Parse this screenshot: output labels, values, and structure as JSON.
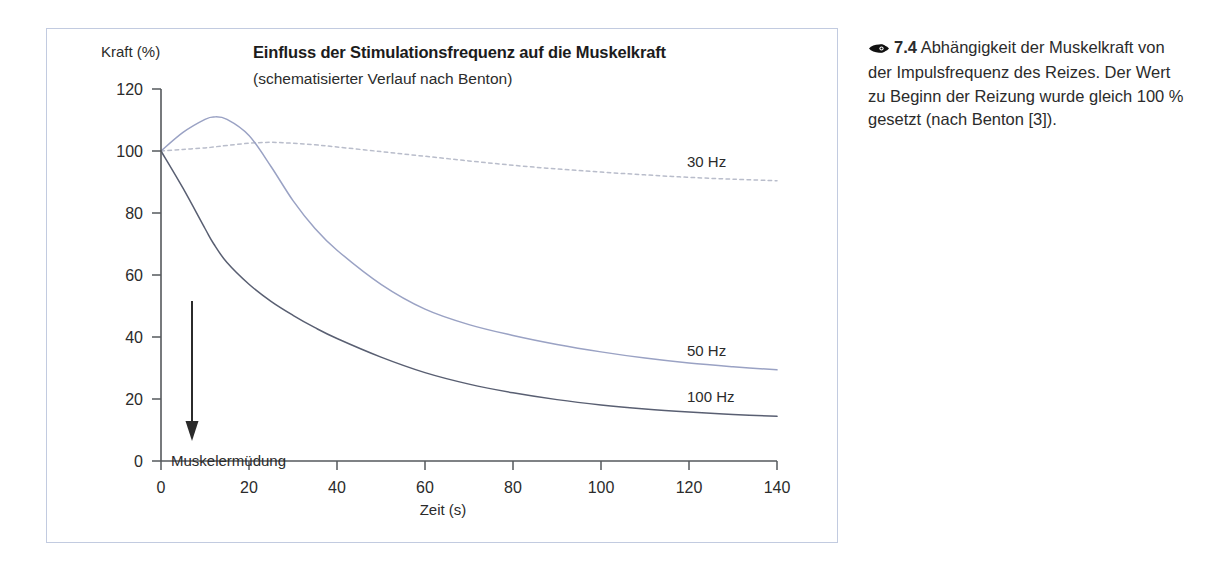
{
  "figure": {
    "caption_icon": "eye-icon",
    "caption_number": "7.4",
    "caption_text": "Abhängigkeit der Muskelkraft von der Impulsfrequenz des Reizes. Der Wert zu Beginn der Reizung wurde gleich 100 % gesetzt (nach Benton [3])."
  },
  "chart_data": {
    "type": "line",
    "title": "Einfluss der Stimulationsfrequenz auf die Muskelkraft",
    "subtitle": "(schematisierter Verlauf nach Benton)",
    "xlabel": "Zeit (s)",
    "ylabel": "Kraft (%)",
    "xlim": [
      0,
      140
    ],
    "ylim": [
      0,
      120
    ],
    "xticks": [
      0,
      20,
      40,
      60,
      80,
      100,
      120,
      140
    ],
    "yticks": [
      0,
      20,
      40,
      60,
      80,
      100,
      120
    ],
    "grid": false,
    "legend_position": "inline-right",
    "annotations": [
      {
        "text": "Muskelermüdung",
        "arrow": "down",
        "x": 7,
        "y_from": 52,
        "y_to": 18
      }
    ],
    "x": [
      0,
      5,
      10,
      12,
      15,
      20,
      25,
      30,
      35,
      40,
      50,
      60,
      70,
      80,
      90,
      100,
      110,
      120,
      130,
      140
    ],
    "series": [
      {
        "name": "30 Hz",
        "label": "30 Hz",
        "color": "#b9bdcb",
        "style": "dotted",
        "values": [
          100,
          100.5,
          101,
          101.3,
          101.8,
          102.5,
          102.8,
          102.5,
          102,
          101.3,
          99.8,
          98.3,
          96.8,
          95.4,
          94.2,
          93.2,
          92.3,
          91.5,
          90.9,
          90.4
        ]
      },
      {
        "name": "50 Hz",
        "label": "50 Hz",
        "color": "#9aa2c4",
        "style": "solid",
        "values": [
          100,
          106,
          110.2,
          111,
          110.2,
          105,
          95,
          84,
          75,
          68,
          57,
          49,
          44,
          40.5,
          37.6,
          35.2,
          33.2,
          31.6,
          30.4,
          29.4
        ]
      },
      {
        "name": "100 Hz",
        "label": "100 Hz",
        "color": "#595f72",
        "style": "solid",
        "values": [
          100,
          88,
          75,
          70,
          64,
          57,
          51.5,
          47,
          43,
          39.5,
          33.5,
          28.5,
          24.8,
          22,
          19.8,
          18.1,
          16.8,
          15.8,
          15.0,
          14.4
        ]
      }
    ]
  }
}
